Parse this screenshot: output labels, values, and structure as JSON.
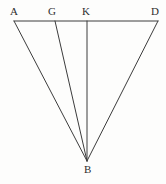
{
  "figure": {
    "background_color": "#fdfdfc",
    "stroke_color": "#3c3c3c",
    "label_color": "#2e2e2e",
    "stroke_width": 1,
    "labels": {
      "a": "A",
      "g": "G",
      "k": "K",
      "d": "D",
      "b": "B"
    },
    "points": {
      "A": {
        "x": 14,
        "y": 21
      },
      "G": {
        "x": 55,
        "y": 21
      },
      "K": {
        "x": 87,
        "y": 21
      },
      "D": {
        "x": 158,
        "y": 21
      },
      "B": {
        "x": 87,
        "y": 161
      }
    },
    "label_positions": {
      "A": {
        "x": 10,
        "y": 6
      },
      "G": {
        "x": 48,
        "y": 6
      },
      "K": {
        "x": 82,
        "y": 6
      },
      "D": {
        "x": 151,
        "y": 6
      },
      "B": {
        "x": 84,
        "y": 164
      }
    },
    "segments": [
      {
        "name": "segment-AD",
        "from": "A",
        "to": "D"
      },
      {
        "name": "segment-AB",
        "from": "A",
        "to": "B"
      },
      {
        "name": "segment-GB",
        "from": "G",
        "to": "B"
      },
      {
        "name": "segment-KB",
        "from": "K",
        "to": "B"
      },
      {
        "name": "segment-DB",
        "from": "D",
        "to": "B"
      }
    ]
  }
}
